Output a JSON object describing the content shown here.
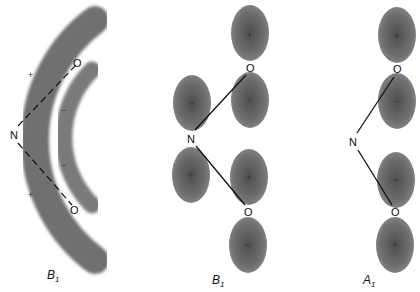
{
  "figure": {
    "colors": {
      "lobe": "#6e6e6e",
      "lobe_center": "#505050",
      "bond": "#111111",
      "background": "#ffffff"
    },
    "panels": [
      {
        "id": "delocalized-b1",
        "label": "B",
        "label_sub": "1",
        "atoms": {
          "n": "N",
          "o_top": "O",
          "o_bottom": "O"
        },
        "bond_style": "dashed",
        "signs": {
          "outer_top": "+",
          "outer_bottom": "+",
          "inner_top": "−",
          "inner_bottom": "−"
        }
      },
      {
        "id": "atomic-b1",
        "label": "B",
        "label_sub": "1",
        "atoms": {
          "n": "N",
          "o_top": "O",
          "o_bottom": "O"
        },
        "bond_style": "solid",
        "signs": {
          "otop_upper": "+",
          "otop_lower": "−",
          "n_upper": "−",
          "n_lower": "+",
          "obot_upper": "+",
          "obot_lower": "−"
        }
      },
      {
        "id": "atomic-a1",
        "label": "A",
        "label_sub": "1",
        "atoms": {
          "n": "N",
          "o_top": "O",
          "o_bottom": "O"
        },
        "bond_style": "solid",
        "signs": {
          "otop_upper": "+",
          "otop_lower": "−",
          "obot_upper": "−",
          "obot_lower": "+"
        }
      }
    ]
  }
}
